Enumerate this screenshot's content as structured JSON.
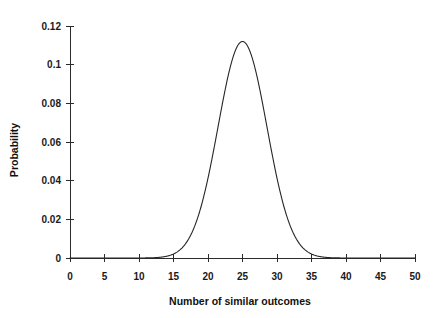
{
  "chart_data": {
    "type": "line",
    "title": "",
    "subtitle": "",
    "xlabel": "Number of similar outcomes",
    "ylabel": "Probability",
    "xlim": [
      0,
      50
    ],
    "ylim": [
      0,
      0.12
    ],
    "grid": false,
    "legend": null,
    "xticks": [
      0,
      5,
      10,
      15,
      20,
      25,
      30,
      35,
      40,
      45,
      50
    ],
    "xtick_labels": [
      "0",
      "5",
      "10",
      "15",
      "20",
      "25",
      "30",
      "35",
      "40",
      "45",
      "50"
    ],
    "yticks": [
      0,
      0.02,
      0.04,
      0.06,
      0.08,
      0.1,
      0.12
    ],
    "ytick_labels": [
      "0",
      "0.02",
      "0.04",
      "0.06",
      "0.08",
      "0.1",
      "0.12"
    ],
    "series": [
      {
        "name": "Binomial distribution (n=50, p=0.5)",
        "color": "#262626",
        "peak_x": 25,
        "peak_y": 0.112,
        "mean": 25,
        "std": 3.54,
        "x": [
          0,
          1,
          2,
          3,
          4,
          5,
          6,
          7,
          8,
          9,
          10,
          11,
          12,
          13,
          14,
          15,
          16,
          17,
          18,
          19,
          20,
          21,
          22,
          23,
          24,
          25,
          26,
          27,
          28,
          29,
          30,
          31,
          32,
          33,
          34,
          35,
          36,
          37,
          38,
          39,
          40,
          41,
          42,
          43,
          44,
          45,
          46,
          47,
          48,
          49,
          50
        ],
        "values": [
          0,
          0,
          0,
          0,
          0,
          0,
          0,
          0,
          0,
          0,
          0,
          0.0001,
          0.0002,
          0.0005,
          0.0012,
          0.0026,
          0.0052,
          0.0096,
          0.016,
          0.0244,
          0.0342,
          0.0438,
          0.0514,
          0.0553,
          0.0553,
          0.0515,
          0.0553,
          0.0553,
          0.0514,
          0.0438,
          0.0342,
          0.0244,
          0.016,
          0.0096,
          0.0052,
          0.0026,
          0.0012,
          0.0005,
          0.0002,
          0.0001,
          0,
          0,
          0,
          0,
          0,
          0,
          0,
          0,
          0,
          0,
          0
        ]
      }
    ]
  },
  "axes": {
    "x_axis_label": "Number of similar outcomes",
    "y_axis_label": "Probability"
  }
}
